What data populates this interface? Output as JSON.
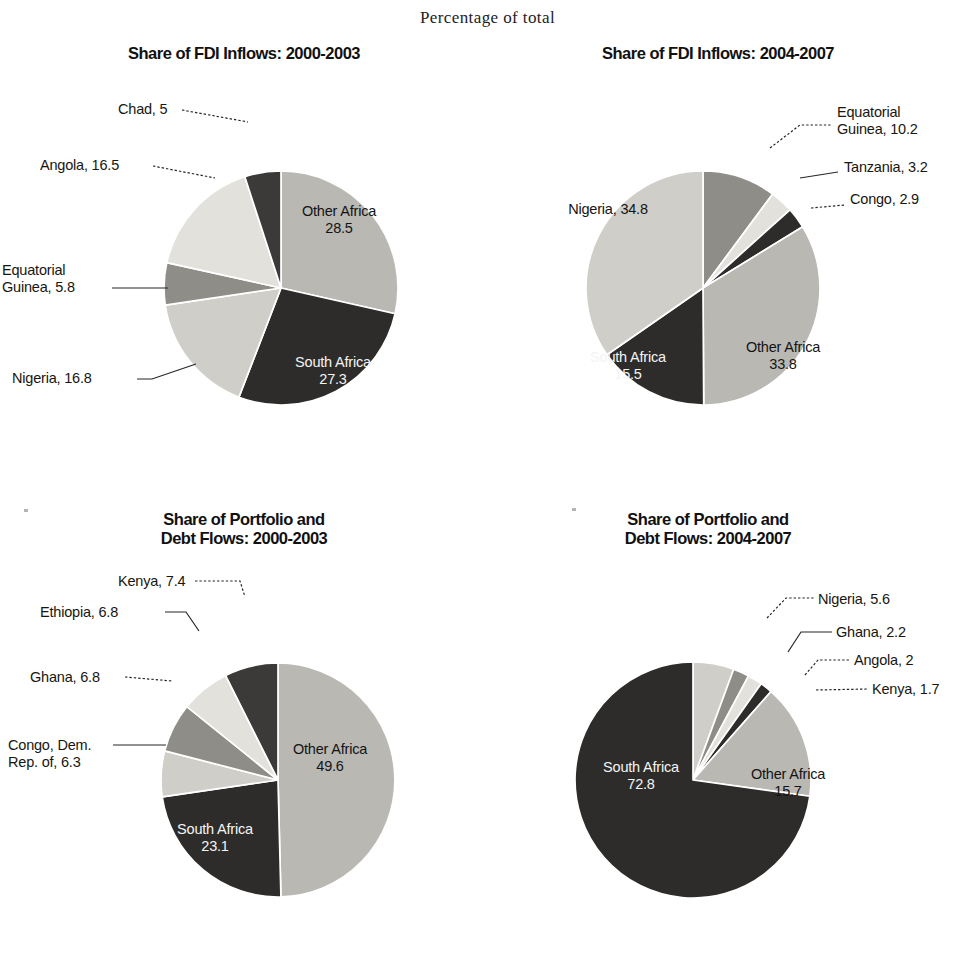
{
  "figure": {
    "super_title": "Percentage of total",
    "width": 975,
    "height": 969
  },
  "palette": {
    "light_gray": "#b9b8b3",
    "lighter_gray": "#cfcec9",
    "very_light_gray": "#e2e1dc",
    "medium_gray": "#8e8d88",
    "dark": "#3b3a38",
    "darker": "#2d2c2a",
    "separator": "#ffffff",
    "text_dark": "#18160f",
    "text_light": "#f4f4f4"
  },
  "chart_data": [
    {
      "id": "fdi-2000-2003",
      "type": "pie",
      "title": "Share of FDI Inflows: 2000-2003",
      "unit": "percent",
      "start_angle_deg": 0,
      "direction": "clockwise",
      "categories": [
        "Other Africa",
        "South Africa",
        "Nigeria",
        "Equatorial Guinea",
        "Angola",
        "Chad"
      ],
      "values": [
        28.5,
        27.3,
        16.8,
        5.8,
        16.5,
        5.0
      ],
      "labels": [
        {
          "name": "Other Africa",
          "value": "28.5",
          "text": "Other Africa\n28.5",
          "placement": "inside",
          "color": "light_gray"
        },
        {
          "name": "South Africa",
          "value": "27.3",
          "text": "South Africa\n27.3",
          "placement": "inside",
          "color": "darker"
        },
        {
          "name": "Nigeria",
          "value": "16.8",
          "text": "Nigeria, 16.8",
          "placement": "callout",
          "color": "lighter_gray"
        },
        {
          "name": "Equatorial Guinea",
          "value": "5.8",
          "text": "Equatorial\nGuinea, 5.8",
          "placement": "callout",
          "color": "medium_gray"
        },
        {
          "name": "Angola",
          "value": "16.5",
          "text": "Angola, 16.5",
          "placement": "callout",
          "color": "very_light_gray"
        },
        {
          "name": "Chad",
          "value": "5",
          "text": "Chad, 5",
          "placement": "callout",
          "color": "dark"
        }
      ]
    },
    {
      "id": "fdi-2004-2007",
      "type": "pie",
      "title": "Share of FDI Inflows: 2004-2007",
      "unit": "percent",
      "start_angle_deg": 0,
      "direction": "clockwise",
      "categories": [
        "Equatorial Guinea",
        "Tanzania",
        "Congo",
        "Other Africa",
        "South Africa",
        "Nigeria"
      ],
      "values": [
        10.2,
        3.2,
        2.9,
        33.8,
        15.5,
        34.8
      ],
      "labels": [
        {
          "name": "Equatorial Guinea",
          "value": "10.2",
          "text": "Equatorial\nGuinea, 10.2",
          "placement": "callout",
          "color": "medium_gray"
        },
        {
          "name": "Tanzania",
          "value": "3.2",
          "text": "Tanzania, 3.2",
          "placement": "callout",
          "color": "very_light_gray"
        },
        {
          "name": "Congo",
          "value": "2.9",
          "text": "Congo, 2.9",
          "placement": "callout",
          "color": "darker"
        },
        {
          "name": "Other Africa",
          "value": "33.8",
          "text": "Other Africa\n33.8",
          "placement": "inside",
          "color": "light_gray"
        },
        {
          "name": "South Africa",
          "value": "15.5",
          "text": "South Africa\n15.5",
          "placement": "inside",
          "color": "darker"
        },
        {
          "name": "Nigeria",
          "value": "34.8",
          "text": "Nigeria, 34.8",
          "placement": "inside",
          "color": "lighter_gray"
        }
      ]
    },
    {
      "id": "portfolio-2000-2003",
      "type": "pie",
      "title": "Share of Portfolio and\nDebt Flows: 2000-2003",
      "unit": "percent",
      "start_angle_deg": 0,
      "direction": "clockwise",
      "categories": [
        "Other Africa",
        "South Africa",
        "Congo, Dem. Rep. of",
        "Ghana",
        "Ethiopia",
        "Kenya"
      ],
      "values": [
        49.6,
        23.1,
        6.3,
        6.8,
        6.8,
        7.4
      ],
      "labels": [
        {
          "name": "Other Africa",
          "value": "49.6",
          "text": "Other Africa\n49.6",
          "placement": "inside",
          "color": "light_gray"
        },
        {
          "name": "South Africa",
          "value": "23.1",
          "text": "South Africa\n23.1",
          "placement": "inside",
          "color": "darker"
        },
        {
          "name": "Congo, Dem. Rep. of",
          "value": "6.3",
          "text": "Congo, Dem.\nRep. of, 6.3",
          "placement": "callout",
          "color": "lighter_gray"
        },
        {
          "name": "Ghana",
          "value": "6.8",
          "text": "Ghana, 6.8",
          "placement": "callout",
          "color": "medium_gray"
        },
        {
          "name": "Ethiopia",
          "value": "6.8",
          "text": "Ethiopia, 6.8",
          "placement": "callout",
          "color": "very_light_gray"
        },
        {
          "name": "Kenya",
          "value": "7.4",
          "text": "Kenya, 7.4",
          "placement": "callout",
          "color": "dark"
        }
      ]
    },
    {
      "id": "portfolio-2004-2007",
      "type": "pie",
      "title": "Share of Portfolio and\nDebt Flows: 2004-2007",
      "unit": "percent",
      "start_angle_deg": 0,
      "direction": "clockwise",
      "categories": [
        "Nigeria",
        "Ghana",
        "Angola",
        "Kenya",
        "Other Africa",
        "South Africa"
      ],
      "values": [
        5.6,
        2.2,
        2.0,
        1.7,
        15.7,
        72.8
      ],
      "labels": [
        {
          "name": "Nigeria",
          "value": "5.6",
          "text": "Nigeria, 5.6",
          "placement": "callout",
          "color": "lighter_gray"
        },
        {
          "name": "Ghana",
          "value": "2.2",
          "text": "Ghana, 2.2",
          "placement": "callout",
          "color": "medium_gray"
        },
        {
          "name": "Angola",
          "value": "2",
          "text": "Angola, 2",
          "placement": "callout",
          "color": "very_light_gray"
        },
        {
          "name": "Kenya",
          "value": "1.7",
          "text": "Kenya, 1.7",
          "placement": "callout",
          "color": "darker"
        },
        {
          "name": "Other Africa",
          "value": "15.7",
          "text": "Other Africa\n15.7",
          "placement": "inside",
          "color": "light_gray"
        },
        {
          "name": "South Africa",
          "value": "72.8",
          "text": "South Africa\n72.8",
          "placement": "inside",
          "color": "darker"
        }
      ]
    }
  ],
  "panels": {
    "p1": {
      "title": "Share of FDI Inflows: 2000-2003"
    },
    "p2": {
      "title": "Share of FDI Inflows: 2004-2007"
    },
    "p3": {
      "title": "Share of Portfolio and\nDebt Flows: 2000-2003"
    },
    "p4": {
      "title": "Share of Portfolio and\nDebt Flows: 2004-2007"
    }
  }
}
